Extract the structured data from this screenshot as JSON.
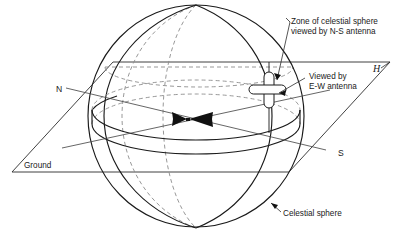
{
  "figure": {
    "labels": {
      "zone_line1": "Zone of celestial sphere",
      "zone_line2": "viewed by N-S antenna",
      "viewed_line1": "Viewed by",
      "viewed_line2": "E-W antenna",
      "horizon": "H",
      "north": "N",
      "south": "S",
      "ground": "Ground",
      "celestial_sphere": "Celestial sphere"
    },
    "colors": {
      "ink": "#1a1a1a",
      "hidden_line": "#8c8c8c",
      "plane_line": "#2b2b2b",
      "axis_line": "#4a4a4a",
      "background": "#ffffff"
    },
    "geometry": {
      "sphere_center_x": 196,
      "sphere_center_y": 116,
      "sphere_radius_x": 108,
      "sphere_radius_y": 111,
      "equator_ry": 30,
      "ground_plane_y": 172
    }
  }
}
